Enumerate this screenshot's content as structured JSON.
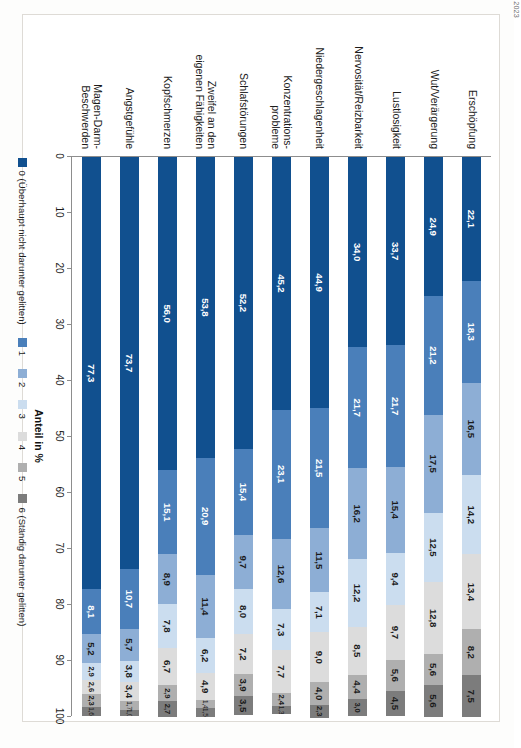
{
  "source_note": "Fehlzeiten-Report 2023",
  "chart_data": {
    "type": "bar",
    "subtype": "stacked-horizontal-100",
    "title": "",
    "xlabel": "Anteil in %",
    "ylabel": "",
    "xlim": [
      0,
      100
    ],
    "grid": false,
    "orientation": "horizontal",
    "page_rotation_deg": 90,
    "legend_position": "bottom",
    "tick_labels": [
      "0",
      "10",
      "20",
      "30",
      "40",
      "50",
      "60",
      "70",
      "80",
      "90",
      "100"
    ],
    "ticks": [
      0,
      10,
      20,
      30,
      40,
      50,
      60,
      70,
      80,
      90,
      100
    ],
    "categories": [
      "Erschöpfung",
      "Wut/Verärgerung",
      "Lustlosigkeit",
      "Nervosität/Reizbarkeit",
      "Niedergeschlagenheit",
      "Konzentrations-\nprobleme",
      "Schlafstörungen",
      "Zweifel an den\neigenen Fähigkeiten",
      "Kopfschmerzen",
      "Angstgefühle",
      "Magen-Darm-\nBeschwerden"
    ],
    "series": [
      {
        "name": "0 (Überhaupt nicht darunter gelitten)",
        "color": "#11508F",
        "label_color": "#ffffff",
        "values": [
          22.1,
          24.9,
          33.7,
          34.0,
          44.9,
          45.2,
          52.2,
          53.8,
          56.0,
          73.7,
          77.3
        ]
      },
      {
        "name": "1",
        "color": "#4A7FBA",
        "label_color": "#ffffff",
        "values": [
          18.3,
          21.2,
          21.7,
          21.7,
          21.5,
          23.1,
          15.4,
          20.9,
          15.1,
          10.7,
          8.1
        ]
      },
      {
        "name": "2",
        "color": "#8DAED5",
        "label_color": "#1b1b1b",
        "values": [
          16.5,
          17.5,
          15.4,
          16.2,
          11.5,
          12.6,
          9.7,
          11.4,
          8.9,
          5.7,
          5.2
        ]
      },
      {
        "name": "3",
        "color": "#CBDDEF",
        "label_color": "#1b1b1b",
        "values": [
          14.2,
          12.5,
          9.4,
          12.2,
          7.1,
          7.3,
          8.0,
          6.2,
          7.8,
          3.8,
          2.9
        ]
      },
      {
        "name": "4",
        "color": "#DCDCDC",
        "label_color": "#1b1b1b",
        "values": [
          13.4,
          12.8,
          9.7,
          8.5,
          9.0,
          7.7,
          7.2,
          4.9,
          6.7,
          3.4,
          2.6
        ]
      },
      {
        "name": "5",
        "color": "#AFAFAF",
        "label_color": "#1b1b1b",
        "values": [
          8.2,
          5.6,
          5.6,
          4.4,
          4.0,
          2.4,
          3.9,
          1.4,
          2.9,
          1.7,
          2.3
        ]
      },
      {
        "name": "6 (Ständig darunter gelitten)",
        "color": "#7C7C7C",
        "label_color": "#1b1b1b",
        "values": [
          7.5,
          5.6,
          4.5,
          3.0,
          2.3,
          1.3,
          3.5,
          1.5,
          2.7,
          1.0,
          1.6
        ]
      }
    ],
    "value_labels": [
      [
        "22,1",
        "18,3",
        "16,5",
        "14,2",
        "13,4",
        "8,2",
        "7,5"
      ],
      [
        "24,9",
        "21,2",
        "17,5",
        "12,5",
        "12,8",
        "5,6",
        "5,6"
      ],
      [
        "33,7",
        "21,7",
        "15,4",
        "9,4",
        "9,7",
        "5,6",
        "4,5"
      ],
      [
        "34,0",
        "21,7",
        "16,2",
        "12,2",
        "8,5",
        "4,4",
        "3,0"
      ],
      [
        "44,9",
        "21,5",
        "11,5",
        "7,1",
        "9,0",
        "4,0",
        "2,3"
      ],
      [
        "45,2",
        "23,1",
        "12,6",
        "7,3",
        "7,7",
        "2,4",
        "1,3"
      ],
      [
        "52,2",
        "15,4",
        "9,7",
        "8,0",
        "7,2",
        "3,9",
        "3,5"
      ],
      [
        "53,8",
        "20,9",
        "11,4",
        "6,2",
        "4,9",
        "1,4",
        "1,5"
      ],
      [
        "56,0",
        "15,1",
        "8,9",
        "7,8",
        "6,7",
        "2,9",
        "2,7"
      ],
      [
        "73,7",
        "10,7",
        "5,7",
        "3,8",
        "3,4",
        "1,7",
        "1,0"
      ],
      [
        "77,3",
        "8,1",
        "5,2",
        "2,9",
        "2,6",
        "2,3",
        "1,6"
      ]
    ]
  }
}
